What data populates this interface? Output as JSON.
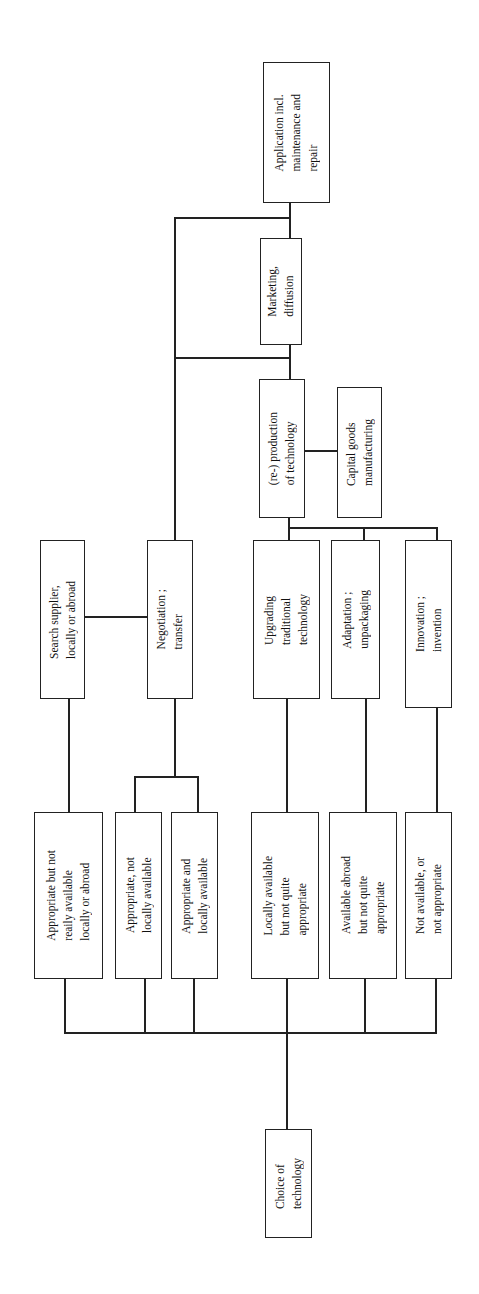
{
  "diagram": {
    "orientation": "rotated 90° counter-clockwise (reads bottom-to-top)",
    "root": "Choice of technology",
    "nodes": {
      "choice": "Choice of\ntechnology",
      "opt_appropriate_not_readily": "Appropriate but not\nreaily available\nlocally or abroad",
      "opt_appropriate_not_local": "Appropriate, not\nlocally available",
      "opt_appropriate_local": "Appropriate and\nlocally  available",
      "opt_local_not_appropriate": "Locally available\nbut not quite\nappropriate",
      "opt_abroad_not_appropriate": "Available abroad\nbut not quite\nappropriate",
      "opt_not_available": "Not available, or\nnot appropriate",
      "search_supplier": "Search supplier,\nlocally or abroad",
      "negotiation": "Negotiation ;\ntransfer",
      "upgrading": "Upgrading\ntraditional\ntechnology",
      "adaptation": "Adaptation ;\nunpackaging",
      "innovation": "Innovation ;\ninvention",
      "reproduction": "(re-) production\nof technology",
      "capital_goods": "Capital goods\nmanufacturing",
      "marketing": "Marketing,\ndiffusion",
      "application": "Application incl.\nmaintenance and\nrepair"
    },
    "edges": [
      [
        "choice",
        "opt_appropriate_not_readily"
      ],
      [
        "choice",
        "opt_appropriate_not_local"
      ],
      [
        "choice",
        "opt_appropriate_local"
      ],
      [
        "choice",
        "opt_local_not_appropriate"
      ],
      [
        "choice",
        "opt_abroad_not_appropriate"
      ],
      [
        "choice",
        "opt_not_available"
      ],
      [
        "opt_appropriate_not_readily",
        "search_supplier"
      ],
      [
        "opt_appropriate_not_local",
        "negotiation"
      ],
      [
        "opt_appropriate_local",
        "negotiation"
      ],
      [
        "search_supplier",
        "negotiation"
      ],
      [
        "opt_local_not_appropriate",
        "upgrading"
      ],
      [
        "opt_abroad_not_appropriate",
        "adaptation"
      ],
      [
        "opt_not_available",
        "innovation"
      ],
      [
        "upgrading",
        "reproduction"
      ],
      [
        "adaptation",
        "reproduction"
      ],
      [
        "innovation",
        "reproduction"
      ],
      [
        "reproduction",
        "capital_goods"
      ],
      [
        "reproduction",
        "marketing"
      ],
      [
        "negotiation",
        "marketing"
      ],
      [
        "marketing",
        "application"
      ],
      [
        "negotiation",
        "application"
      ]
    ]
  }
}
